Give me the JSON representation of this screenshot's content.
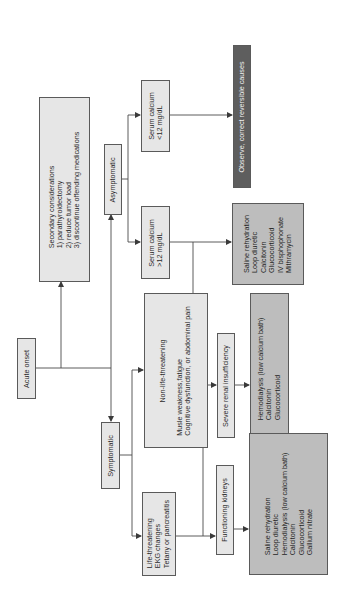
{
  "diagram": {
    "orientation": "rotated 90 degrees counter-clockwise",
    "colors": {
      "light_box": "#e6e6e6",
      "mid_box": "#bdbdbd",
      "dark_box": "#5e5e5e",
      "line": "#4a4a4a"
    },
    "nodes": {
      "acute_onset": {
        "lines": [
          "Acute onset"
        ]
      },
      "secondary": {
        "lines": [
          "Secondary considerations",
          "1) parathyroidectomy",
          "2) reduce tumor load",
          "3) discontinue offending medications"
        ]
      },
      "asymptomatic": {
        "lines": [
          "Asymptomatic"
        ]
      },
      "symptomatic": {
        "lines": [
          "Symptomatic"
        ]
      },
      "serum_low": {
        "lines": [
          "Serum calcium",
          "<12 mg/dL"
        ]
      },
      "serum_high": {
        "lines": [
          "Serum calcium",
          ">12 mg/dL"
        ]
      },
      "non_life": {
        "lines": [
          "Non-life-threatening",
          "",
          "Musle weakness,fatigue",
          "Cognitive dysfunction, or abdominal pain"
        ]
      },
      "life": {
        "lines": [
          "Life-threatening",
          "EKG changes",
          "Tetany or pancreatitis"
        ]
      },
      "observe": {
        "lines": [
          "Observe, correct reversible causes"
        ]
      },
      "treat_high": {
        "lines": [
          "Saline rehydration",
          "Loop diuretic",
          "Calcitonin",
          "Glucocorticoid",
          "IV bisphophonate",
          "Mithramycin"
        ]
      },
      "severe_renal": {
        "lines": [
          "Severe renal insufficiency"
        ]
      },
      "treat_renal": {
        "lines": [
          "Hemodialysis (low calcium bath)",
          "Calcitonin",
          "Glucocorticoid"
        ]
      },
      "functioning": {
        "lines": [
          "Functioning kidneys"
        ]
      },
      "treat_life": {
        "lines": [
          "Saline rehydration",
          "Loop diuretic",
          "Hemodialysis (low calcium bath)",
          "Calcitonin",
          "Glucocorticoid",
          "Gallium nitrate"
        ]
      }
    },
    "edges": [
      [
        "acute_onset",
        "secondary"
      ],
      [
        "acute_onset",
        "asymptomatic"
      ],
      [
        "acute_onset",
        "symptomatic"
      ],
      [
        "asymptomatic",
        "serum_low"
      ],
      [
        "asymptomatic",
        "serum_high"
      ],
      [
        "serum_low",
        "observe"
      ],
      [
        "serum_high",
        "treat_high"
      ],
      [
        "symptomatic",
        "non_life"
      ],
      [
        "symptomatic",
        "life"
      ],
      [
        "non_life",
        "treat_high"
      ],
      [
        "life",
        "severe_renal"
      ],
      [
        "life",
        "functioning"
      ],
      [
        "severe_renal",
        "treat_renal"
      ],
      [
        "functioning",
        "treat_life"
      ]
    ]
  }
}
